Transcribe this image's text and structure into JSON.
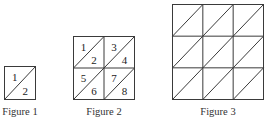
{
  "figures": [
    {
      "caption": "Figure 1",
      "rows": 1,
      "cols": 1,
      "box": {
        "x": 4.5,
        "y": 66.5,
        "w": 31,
        "h": 33
      },
      "caption_pos": {
        "x": 20,
        "y": 115
      },
      "numbers": [
        [
          "1",
          "2"
        ]
      ]
    },
    {
      "caption": "Figure 2",
      "rows": 2,
      "cols": 2,
      "box": {
        "x": 73.5,
        "y": 36.5,
        "w": 61,
        "h": 63
      },
      "caption_pos": {
        "x": 104,
        "y": 115
      },
      "numbers": [
        [
          "1",
          "2"
        ],
        [
          "3",
          "4"
        ],
        [
          "5",
          "6"
        ],
        [
          "7",
          "8"
        ]
      ]
    },
    {
      "caption": "Figure 3",
      "rows": 3,
      "cols": 3,
      "box": {
        "x": 172.5,
        "y": 4.5,
        "w": 91,
        "h": 95
      },
      "caption_pos": {
        "x": 218,
        "y": 115
      },
      "numbers": []
    }
  ],
  "style": {
    "line_color": "#3a3a3a",
    "text_color": "#222222",
    "background": "#ffffff"
  }
}
